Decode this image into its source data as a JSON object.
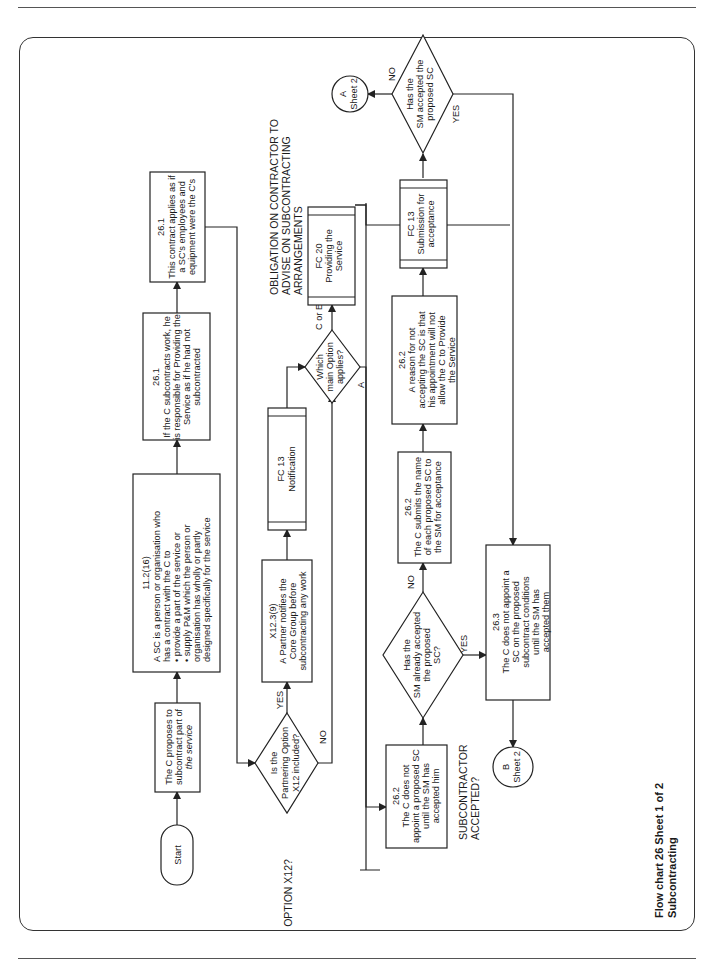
{
  "caption": {
    "line1": "Flow chart 26  Sheet 1 of 2",
    "line2": "Subcontracting"
  },
  "section_labels": {
    "option_x12": "OPTION X12?",
    "obligation": [
      "OBLIGATION ON CONTRACTOR TO",
      "ADVISE ON SUBCONTRACTING",
      "ARRANGEMENTS"
    ],
    "subcontractor_accepted": [
      "SUBCONTRACTOR",
      "ACCEPTED?"
    ]
  },
  "nodes": {
    "start": "Start",
    "proposes": [
      "The C proposes to",
      "subcontract part of",
      "the service"
    ],
    "definition": {
      "ref": "11.2(16)",
      "lines": [
        "A SC is a person or organisation who",
        "has a contract with the C to",
        "• provide a part of the service or",
        "• supply P&M which the person or",
        "   organisation has wholly or partly",
        "   designed specifically for the service"
      ]
    },
    "responsible": {
      "ref": "26.1",
      "lines": [
        "If the C subcontracts work, he",
        "is responsible for Providing the",
        "Service as if he had not",
        "subcontracted"
      ]
    },
    "contract_applies": {
      "ref": "26.1",
      "lines": [
        "This contract applies as if",
        "a SC's employees and",
        "equipment were the C's"
      ]
    },
    "partnering_decision": [
      "Is the",
      "Partnering Option",
      "X12 included?"
    ],
    "partner_notifies": {
      "ref": "X12.3(9)",
      "lines": [
        "A Partner notifies the",
        "Core Group before",
        "subcontracting any work"
      ]
    },
    "fc13_notification": [
      "FC 13",
      "Notification"
    ],
    "main_option_decision": [
      "Which",
      "main Option",
      "applies?"
    ],
    "fc20": [
      "FC 20",
      "Providing the",
      "Service"
    ],
    "not_appoint": {
      "ref": "26.2",
      "lines": [
        "The C does not",
        "appoint a proposed SC",
        "until the SM has",
        "accepted him"
      ]
    },
    "already_accepted_decision": [
      "Has the",
      "SM already accepted",
      "the proposed",
      "SC?"
    ],
    "submits_name": {
      "ref": "26.2",
      "lines": [
        "The C submits the name",
        "of each proposed SC to",
        "the SM for acceptance"
      ]
    },
    "reason": {
      "ref": "26.2",
      "lines": [
        "A reason for not",
        "accepting the SC is that",
        "his appointment will not",
        "allow the C to Provide",
        "the Service"
      ]
    },
    "fc13_submission": [
      "FC 13",
      "Submission for",
      "acceptance"
    ],
    "accepted_decision": [
      "Has the",
      "SM accepted the",
      "proposed SC"
    ],
    "conditions": {
      "ref": "26.3",
      "lines": [
        "The C does not appoint a",
        "SC on the proposed",
        "subcontract conditions",
        "until the SM has",
        "accepted them"
      ]
    },
    "connector_a": [
      "A",
      "Sheet 2"
    ],
    "connector_b": [
      "B",
      "Sheet 2"
    ]
  },
  "edge_labels": {
    "yes": "YES",
    "no": "NO",
    "c_or_e": "C or E",
    "a": "A"
  }
}
